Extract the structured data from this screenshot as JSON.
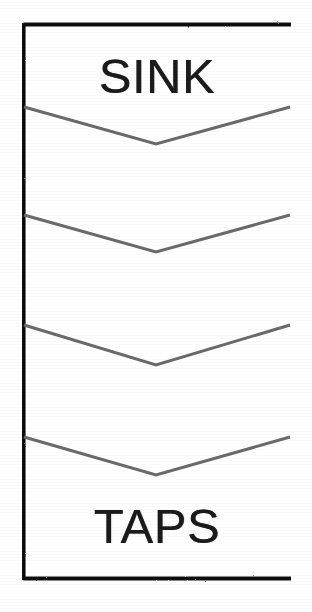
{
  "document": {
    "type": "scanned-line-drawing",
    "title": "Flow direction panel",
    "background_color": "#ffffff"
  },
  "panel": {
    "name": "bordered-panel",
    "border_color": "#111111",
    "fill_color": "#ffffff",
    "geometry": {
      "left": 22,
      "top": 23,
      "width": 270,
      "height": 557
    },
    "labels": {
      "top": "SINK",
      "bottom": "TAPS"
    }
  },
  "chevrons": {
    "name": "flow-direction-chevrons",
    "direction": "down",
    "count": 4,
    "stroke_color": "#6a6a6a",
    "stroke_width": 3,
    "apex_x": 134,
    "items": [
      {
        "index": 1,
        "edge_y": 84,
        "apex_y": 121
      },
      {
        "index": 2,
        "edge_y": 192,
        "apex_y": 229
      },
      {
        "index": 3,
        "edge_y": 302,
        "apex_y": 342
      },
      {
        "index": 4,
        "edge_y": 414,
        "apex_y": 452
      }
    ]
  },
  "colors": {
    "ink_black": "#1b1b1b",
    "frame_black": "#111111",
    "chevron_gray": "#6a6a6a",
    "paper_white": "#ffffff"
  }
}
